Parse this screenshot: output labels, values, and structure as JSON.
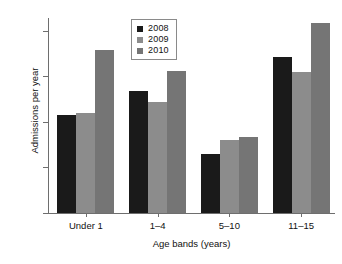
{
  "chart_data": {
    "type": "bar",
    "title": "",
    "subtitle": "",
    "xlabel": "Age bands (years)",
    "ylabel": "Admissions per year",
    "categories": [
      "Under 1",
      "1–4",
      "5–10",
      "11–15"
    ],
    "series": [
      {
        "name": "2008",
        "color": "#1a1a1a",
        "values": [
          108,
          134,
          65,
          172
        ]
      },
      {
        "name": "2009",
        "color": "#8c8c8c",
        "values": [
          110,
          122,
          80,
          156
        ]
      },
      {
        "name": "2010",
        "color": "#757575",
        "values": [
          180,
          157,
          84,
          210
        ]
      }
    ],
    "ylim": [
      0,
      215
    ],
    "yticks": [
      0,
      50,
      100,
      150,
      200
    ],
    "ytick_labels": [
      "0",
      "50",
      "100",
      "150",
      "200"
    ],
    "grid": false,
    "legend_position": "top-center",
    "axis_color": "#6e6e6e"
  },
  "legend": {
    "entries": [
      {
        "label": "2008",
        "color": "#1a1a1a"
      },
      {
        "label": "2009",
        "color": "#8c8c8c"
      },
      {
        "label": "2010",
        "color": "#757575"
      }
    ]
  }
}
